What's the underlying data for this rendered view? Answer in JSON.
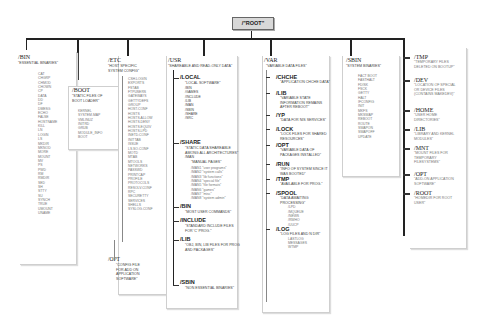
{
  "root": {
    "label": "/\"ROOT\""
  },
  "bin": {
    "name": "/BIN",
    "desc": "\"ESSENTIAL BINARIES\"",
    "items": [
      "CAT",
      "CHGRP",
      "CHMOD",
      "CHOWN",
      "CP",
      "DATA",
      "DD",
      "DF",
      "DMESG",
      "ECHO",
      "FALSE",
      "HOSTNAME",
      "KILL",
      "LN",
      "LOGIN",
      "LS",
      "MKDIR",
      "MKNOD",
      "MORE",
      "MOUNT",
      "MV",
      "PS",
      "PWD",
      "RM",
      "RMDIR",
      "SED",
      "SH",
      "STTY",
      "SU",
      "SYNCH",
      "TRUE",
      "UMOUNT",
      "UNAME"
    ]
  },
  "boot": {
    "name": "/BOOT",
    "desc": [
      "\"STATIC FILES OF",
      "BOOT LOADER\""
    ],
    "items": [
      "KERNEL",
      "SYSTEM.MAP",
      "VMLINUZ",
      "INITRD",
      "GRUB",
      "MODULE_INFO",
      "BOOT"
    ]
  },
  "etc": {
    "name": "/ETC",
    "desc": [
      "\"HOST SPECIFIC",
      "SYSTEM CONFIG\""
    ],
    "items": [
      "CSH.LOGIN",
      "EXPORTS",
      "FSTAB",
      "FTPUSERS",
      "GATEWAYS",
      "GETTYDEFS",
      "GROUP",
      "HOST.CONF",
      "HOSTS",
      "HOSTS.ALLOW",
      "HOSTS.DENY",
      "HOSTS.EQUIV",
      "HOSTS.LPD",
      "INETD.CONF",
      "INITTAB",
      "ISSUE",
      "LS.SO.CONF",
      "MOTD",
      "MTAB",
      "MTOOLS",
      "NETWORKS",
      "PASSWD",
      "PRINTCAP",
      "PROFILE",
      "PROTOCOLS",
      "RESOLV.CONF",
      "RPC",
      "SECURETTY",
      "SERVICES",
      "SHELLS",
      "SYSLOG.CONF"
    ]
  },
  "opt_etc": {
    "name": "/OPT",
    "desc": [
      "\"CONFIG FILE",
      "FOR ADD ON",
      "APPLICATION",
      "SOFTWARE\""
    ]
  },
  "usr": {
    "name": "/USR",
    "desc": "\"SHAREABLE AND READ-ONLY DATA\"",
    "local": {
      "name": "/LOCAL",
      "desc": "\"LOCAL SOFTWARE\"",
      "items": [
        "/BIN",
        "/GAMES",
        "/INCLUDE",
        "/LIB",
        "/MAN",
        "/SBIN",
        "/SHARE",
        "/SRC"
      ]
    },
    "share": {
      "name": "/SHARE",
      "desc": [
        "\"STATIC DATA SHAREABLE",
        "AMONG ALL ARCHITECTURES\""
      ],
      "man": "/MAN",
      "man_desc": "\"MANUAL PAGES\"",
      "man_items": [
        "/MAN1 \"user programs\"",
        "/MAN2 \"system calls\"",
        "/MAN3 \"lib functions\"",
        "/MAN4 \"special file\"",
        "/MAN5 \"file formats\"",
        "/MAN6 \"games\"",
        "/MAN7 \"misc\"",
        "/MAN8 \"system admin\""
      ]
    },
    "bin": {
      "name": "/BIN",
      "desc": "\"MOST USER COMMANDS\""
    },
    "include": {
      "name": "/INCLUDE",
      "desc": [
        "\"STANDARD INCLUDE FILES",
        "FOR 'C' PROG.\""
      ]
    },
    "lib": {
      "name": "/LIB",
      "desc": [
        "\"OBJ, BIN, LIB FILES FOR PROG",
        "AND PACKAGES\""
      ]
    },
    "sbin": {
      "name": "/SBIN",
      "desc": "\"NON ESSENTIAL BINARIES\""
    }
  },
  "var": {
    "name": "/VAR",
    "desc": "\"VARIABLE DATA FILES\"",
    "children": [
      {
        "name": "/CHCHE",
        "desc": [
          "\"APPLICATION CHCHE DATA\""
        ]
      },
      {
        "name": "/LIB",
        "desc": [
          "\"VARIABLE STATE",
          "INFORMATION REMAINS",
          "AFTER REBOOT\""
        ]
      },
      {
        "name": "/YP",
        "desc": [
          "\"DATA FOR NIS SERVICES\""
        ]
      },
      {
        "name": "/LOCK",
        "desc": [
          "\"LOCK FILES FOR SHARED",
          "RESOURCES\""
        ]
      },
      {
        "name": "/OPT",
        "desc": [
          "\"VARIABLE DATA OF",
          "PACKAGES INSTALLED\""
        ]
      },
      {
        "name": "/RUN",
        "desc": [
          "\"INFO OF SYSTEM SINCE IT",
          "WAS BOOTED\""
        ]
      },
      {
        "name": "/TMP",
        "desc": [
          "\"AVAILABLE FOR PROG.\""
        ]
      },
      {
        "name": "/SPOOL",
        "desc": [
          "\"DATA AWAITING",
          "PROCESSING\""
        ],
        "items": [
          "/LPD",
          "/MQUEUE",
          "/NEWS",
          "/RWHO",
          "/UUCP"
        ]
      },
      {
        "name": "/LOG",
        "desc": [
          "\"LOG FILES AND N DIR\""
        ],
        "items": [
          "LASTLOG",
          "MESSAGES",
          "WTMP"
        ]
      }
    ]
  },
  "sbin": {
    "name": "/SBIN",
    "desc": "\"SYSTEM BINARIES\"",
    "items": [
      "FACT BOOT",
      "FASTHALT",
      "FDISK",
      "FSCK",
      "GETTY",
      "HALT",
      "IFCONFIG",
      "INIT",
      "MKFS",
      "MKSWAP",
      "REBOOT",
      "ROUTE",
      "SWAPON",
      "SWAPOFF",
      "UPDATE"
    ]
  },
  "right": [
    {
      "name": "/TMP",
      "desc": [
        "\"TEMPORARY FILES",
        "DELETED ON BOOTUP\""
      ]
    },
    {
      "name": "/DEV",
      "desc": [
        "\"LOCATION OF SPECIAL",
        "OR DEVICE FILES",
        "(CONTAINS MAKEDEV)\""
      ]
    },
    {
      "name": "/HOME",
      "desc": [
        "\"USER HOME",
        "DIRECTORIES\""
      ]
    },
    {
      "name": "/LIB",
      "desc": [
        "\"LIBRARY AND KERNEL",
        "MODULES\""
      ]
    },
    {
      "name": "/MNT",
      "desc": [
        "\"MOUNT FILES FOR",
        "TEMPORARY",
        "FILESYSTEMS\""
      ]
    },
    {
      "name": "/OPT",
      "desc": [
        "\"ADD-ON APPLICATION",
        "SOFTWARE\""
      ]
    },
    {
      "name": "/ROOT",
      "desc": [
        "\"HOMEDIR FOR ROOT",
        "USER\""
      ]
    }
  ]
}
